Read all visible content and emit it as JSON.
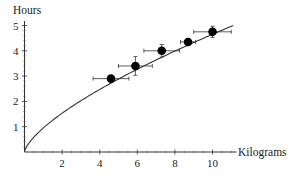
{
  "chart_data": {
    "type": "scatter",
    "title": "",
    "xlabel": "Kilograms",
    "ylabel": "Hours",
    "xlim": [
      0,
      11.3
    ],
    "ylim": [
      0,
      5.1
    ],
    "x_ticks": [
      2,
      4,
      6,
      8,
      10
    ],
    "y_ticks": [
      1,
      2,
      3,
      4,
      5
    ],
    "x_tick_labels": [
      "2",
      "4",
      "6",
      "8",
      "10"
    ],
    "y_tick_labels": [
      "1",
      "2",
      "3",
      "4",
      "5"
    ],
    "grid": false,
    "legend": null,
    "series": [
      {
        "name": "measurements",
        "kind": "scatter_with_error_bars",
        "points": [
          {
            "x": 4.6,
            "y": 2.9,
            "xerr": 0.95,
            "yerr": 0.0
          },
          {
            "x": 5.9,
            "y": 3.4,
            "xerr": 0.9,
            "yerr": 0.37
          },
          {
            "x": 7.3,
            "y": 4.0,
            "xerr": 0.95,
            "yerr": 0.25
          },
          {
            "x": 8.7,
            "y": 4.35,
            "xerr": 0.4,
            "yerr": 0.0
          },
          {
            "x": 10.0,
            "y": 4.75,
            "xerr": 1.0,
            "yerr": 0.22
          }
        ]
      },
      {
        "name": "fit curve",
        "kind": "line",
        "formula": "y = 0.95 * x^0.69",
        "coef": 0.95,
        "exponent": 0.69,
        "x_range": [
          0,
          11.1
        ]
      }
    ]
  }
}
